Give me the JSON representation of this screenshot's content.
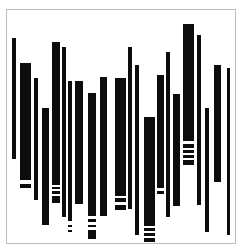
{
  "artwork": {
    "title": "",
    "style": "abstract vertical barcode bars",
    "colors": {
      "background": "#ffffff",
      "bar": "#0d0d0d",
      "frame": "#bdbdbd"
    },
    "frame": {
      "x": 6,
      "y": 9,
      "width": 230,
      "height": 235
    },
    "bars": [
      {
        "x": 12,
        "w": 4,
        "segments": [
          [
            38,
            159
          ]
        ]
      },
      {
        "x": 20,
        "w": 11,
        "segments": [
          [
            63,
            180
          ],
          [
            184,
            188
          ]
        ]
      },
      {
        "x": 34,
        "w": 4,
        "segments": [
          [
            78,
            200
          ]
        ]
      },
      {
        "x": 42,
        "w": 7,
        "segments": [
          [
            108,
            225
          ]
        ]
      },
      {
        "x": 52,
        "w": 8,
        "segments": [
          [
            42,
            185
          ],
          [
            187,
            189
          ],
          [
            191,
            194
          ],
          [
            196,
            203
          ]
        ]
      },
      {
        "x": 62,
        "w": 4,
        "segments": [
          [
            47,
            217
          ]
        ]
      },
      {
        "x": 68,
        "w": 4,
        "segments": [
          [
            81,
            221
          ],
          [
            225,
            227
          ],
          [
            230,
            232
          ]
        ]
      },
      {
        "x": 75,
        "w": 8,
        "segments": [
          [
            81,
            204
          ]
        ]
      },
      {
        "x": 88,
        "w": 8,
        "segments": [
          [
            93,
            216
          ],
          [
            219,
            222
          ],
          [
            225,
            227
          ],
          [
            230,
            239
          ]
        ]
      },
      {
        "x": 100,
        "w": 7,
        "segments": [
          [
            77,
            216
          ]
        ]
      },
      {
        "x": 115,
        "w": 11,
        "segments": [
          [
            78,
            196
          ],
          [
            198,
            202
          ],
          [
            205,
            210
          ]
        ]
      },
      {
        "x": 128,
        "w": 4,
        "segments": [
          [
            47,
            209
          ]
        ]
      },
      {
        "x": 135,
        "w": 4,
        "segments": [
          [
            65,
            235
          ]
        ]
      },
      {
        "x": 144,
        "w": 11,
        "segments": [
          [
            117,
            226
          ],
          [
            228,
            231
          ],
          [
            233,
            236
          ],
          [
            238,
            242
          ]
        ]
      },
      {
        "x": 157,
        "w": 7,
        "segments": [
          [
            75,
            188
          ],
          [
            191,
            194
          ]
        ]
      },
      {
        "x": 166,
        "w": 4,
        "segments": [
          [
            52,
            217
          ]
        ]
      },
      {
        "x": 173,
        "w": 7,
        "segments": [
          [
            94,
            206
          ]
        ]
      },
      {
        "x": 183,
        "w": 11,
        "segments": [
          [
            24,
            141
          ],
          [
            144,
            148
          ],
          [
            150,
            153
          ],
          [
            155,
            158
          ],
          [
            160,
            165
          ]
        ]
      },
      {
        "x": 197,
        "w": 4,
        "segments": [
          [
            35,
            205
          ]
        ]
      },
      {
        "x": 205,
        "w": 4,
        "segments": [
          [
            108,
            232
          ]
        ]
      },
      {
        "x": 214,
        "w": 7,
        "segments": [
          [
            65,
            182
          ]
        ]
      },
      {
        "x": 227,
        "w": 3,
        "segments": [
          [
            68,
            235
          ]
        ]
      }
    ]
  }
}
